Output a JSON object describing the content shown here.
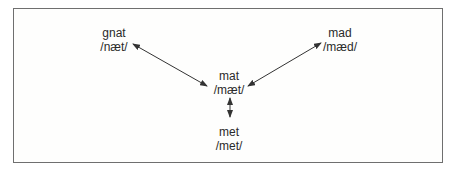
{
  "diagram": {
    "nodes": [
      {
        "id": "gnat",
        "word": "gnat",
        "ipa": "/næt/"
      },
      {
        "id": "mad",
        "word": "mad",
        "ipa": "/mæd/"
      },
      {
        "id": "mat",
        "word": "mat",
        "ipa": "/mæt/"
      },
      {
        "id": "met",
        "word": "met",
        "ipa": "/met/"
      }
    ],
    "edges": [
      {
        "from": "gnat",
        "to": "mat",
        "type": "bidirectional"
      },
      {
        "from": "mad",
        "to": "mat",
        "type": "bidirectional"
      },
      {
        "from": "mat",
        "to": "met",
        "type": "bidirectional"
      }
    ],
    "colors": {
      "text": "#2a2a2a",
      "arrow": "#333333",
      "border": "#6f6f6f"
    }
  }
}
